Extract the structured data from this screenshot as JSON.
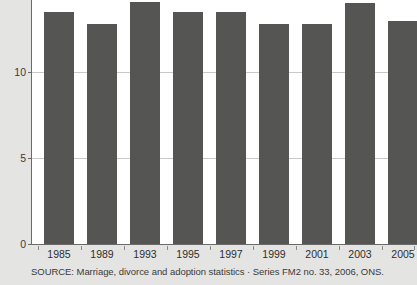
{
  "chart_data": {
    "type": "bar",
    "title": "",
    "subtitle": "",
    "xlabel": "",
    "ylabel": "",
    "categories": [
      "1985",
      "1989",
      "1993",
      "1995",
      "1997",
      "1999",
      "2001",
      "2003",
      "2005"
    ],
    "values": [
      13.5,
      12.8,
      14.1,
      13.5,
      13.5,
      12.8,
      12.8,
      14.0,
      13.0
    ],
    "series": [
      {
        "name": "Rate",
        "values": [
          13.5,
          12.8,
          14.1,
          13.5,
          13.5,
          12.8,
          12.8,
          14.0,
          13.0
        ]
      }
    ],
    "ylim": [
      0,
      14.2
    ],
    "yticks": [
      0,
      5,
      10
    ],
    "ytick_labels": [
      "0",
      "5",
      "10"
    ],
    "grid": true,
    "grid_axis": "y",
    "legend": false,
    "legend_position": "none",
    "bar_color": "#555553",
    "gridline_color": "#c9c9c9",
    "axis_color": "#6a6a6a",
    "plot_background": "#ffffff",
    "figure_background": "#e4e4e3",
    "annotations": []
  },
  "source": {
    "text": "SOURCE: Marriage, divorce and adoption statistics · Series FM2 no. 33, 2006, ONS."
  }
}
